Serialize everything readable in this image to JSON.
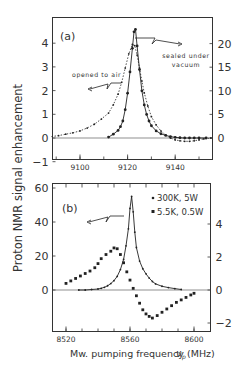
{
  "figure": {
    "ylabel": "Proton NMR signal enhancement",
    "xlabel_main": "Mw. pumping frequency",
    "xlabel_symbol": "ν",
    "xlabel_sub": "p",
    "xlabel_unit": "(MHz)",
    "ink_color": "#222222",
    "background": "#ffffff"
  },
  "chart_data": [
    {
      "panel": "a",
      "type": "line",
      "panel_label": "(a)",
      "title": "",
      "xlabel": "",
      "ylabel": "Proton NMR signal enhancement",
      "xlim": [
        9088,
        9155
      ],
      "ylim_left": [
        -1,
        4.6
      ],
      "ylim_right": [
        -5,
        24
      ],
      "x_ticks": [
        9100,
        9120,
        9140
      ],
      "y_ticks_left": [
        -1,
        0,
        1,
        2,
        3,
        4
      ],
      "y_ticks_right": [
        0,
        5,
        10,
        15,
        20
      ],
      "grid": false,
      "annotations": [
        {
          "text": "opened to air",
          "arrow_to": "left axis"
        },
        {
          "text": "sealed under vacuum",
          "arrow_to": "right axis"
        }
      ],
      "series": [
        {
          "name": "opened to air",
          "axis": "left",
          "style": "dotted line with small dots",
          "x": [
            9088,
            9091,
            9094,
            9097,
            9100,
            9103,
            9106,
            9109,
            9112,
            9114,
            9116,
            9117.5,
            9119,
            9120.5,
            9122,
            9123,
            9124,
            9125,
            9126,
            9127,
            9128.5,
            9130,
            9132,
            9134,
            9136,
            9138,
            9140,
            9142,
            9144,
            9146,
            9148,
            9150,
            9152,
            9155
          ],
          "values": [
            0.06,
            0.1,
            0.16,
            0.22,
            0.3,
            0.42,
            0.58,
            0.8,
            1.05,
            1.4,
            1.85,
            2.35,
            2.95,
            3.55,
            3.95,
            3.9,
            3.5,
            2.95,
            2.4,
            1.9,
            1.35,
            0.9,
            0.55,
            0.3,
            0.12,
            0.0,
            -0.08,
            -0.12,
            -0.14,
            -0.14,
            -0.12,
            -0.08,
            -0.04,
            0.0
          ]
        },
        {
          "name": "sealed under vacuum",
          "axis": "right",
          "style": "solid line with large dots",
          "x": [
            9112,
            9114,
            9116,
            9117,
            9118,
            9119,
            9120,
            9121,
            9122,
            9122.7,
            9123.3,
            9124,
            9125,
            9126,
            9127,
            9128,
            9129,
            9130,
            9132,
            9134,
            9136,
            9138,
            9140,
            9142,
            9144,
            9146,
            9148,
            9150,
            9153
          ],
          "values": [
            0.2,
            0.8,
            1.6,
            2.4,
            3.6,
            6.0,
            9.5,
            14.0,
            19.0,
            22.5,
            23.0,
            19.5,
            14.5,
            10.0,
            7.0,
            5.0,
            3.6,
            2.6,
            1.5,
            0.9,
            0.55,
            0.3,
            0.15,
            0.05,
            0.0,
            0.0,
            0.0,
            0.0,
            0.0
          ]
        }
      ]
    },
    {
      "panel": "b",
      "type": "line",
      "panel_label": "(b)",
      "title": "",
      "xlabel": "Mw. pumping frequency ν_p (MHz)",
      "ylabel": "Proton NMR signal enhancement",
      "xlim": [
        8511,
        8610
      ],
      "ylim_left": [
        -25,
        61
      ],
      "ylim_right": [
        -2.6,
        5.9
      ],
      "x_ticks": [
        8520,
        8560,
        8600
      ],
      "y_ticks_left": [
        0,
        20,
        40,
        60
      ],
      "y_ticks_right": [
        -2,
        0,
        2,
        4
      ],
      "grid": false,
      "legend": [
        "300K, 5W",
        "5.5K, 0.5W"
      ],
      "legend_position": "upper right",
      "series": [
        {
          "name": "300K, 5W",
          "axis": "left",
          "style": "solid line with small dots",
          "x": [
            8528,
            8532,
            8536,
            8540,
            8542,
            8544,
            8546,
            8548,
            8550,
            8552,
            8554,
            8556,
            8557.5,
            8559,
            8560,
            8561,
            8562,
            8563,
            8564,
            8566,
            8568,
            8570,
            8572,
            8574,
            8576,
            8580,
            8584,
            8588,
            8592
          ],
          "values": [
            0,
            0,
            0.3,
            0.6,
            1.0,
            1.6,
            2.5,
            3.8,
            5.5,
            8.0,
            12.0,
            18.0,
            26.0,
            36.0,
            48.0,
            55.0,
            46.0,
            34.0,
            25.0,
            17.0,
            12.5,
            9.5,
            7.0,
            5.0,
            3.6,
            2.2,
            1.4,
            0.8,
            0.3
          ]
        },
        {
          "name": "5.5K, 0.5W",
          "axis": "right",
          "style": "squares",
          "x": [
            8520,
            8523,
            8526,
            8529,
            8532,
            8535,
            8538,
            8540,
            8542,
            8545,
            8548,
            8550,
            8552,
            8554,
            8556,
            8558,
            8560,
            8562,
            8564,
            8566,
            8568,
            8570,
            8572,
            8574,
            8577,
            8580,
            8583,
            8586,
            8589,
            8592,
            8595,
            8598,
            8600
          ],
          "values": [
            0.4,
            0.55,
            0.7,
            0.85,
            1.0,
            1.15,
            1.35,
            1.6,
            1.9,
            2.15,
            2.35,
            2.55,
            2.5,
            2.15,
            1.65,
            1.1,
            0.6,
            0.1,
            -0.35,
            -0.8,
            -1.2,
            -1.45,
            -1.6,
            -1.7,
            -1.55,
            -1.35,
            -1.15,
            -0.95,
            -0.75,
            -0.6,
            -0.45,
            -0.3,
            -0.2
          ]
        }
      ]
    }
  ]
}
